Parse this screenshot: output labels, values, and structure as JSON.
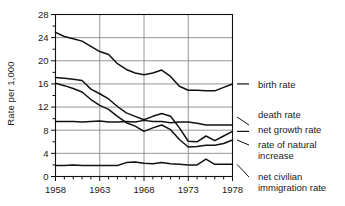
{
  "chart_data": {
    "type": "line",
    "title": "",
    "xlabel": "",
    "ylabel": "Rate per 1,000",
    "xlim": [
      1958,
      1978
    ],
    "ylim": [
      0,
      28
    ],
    "grid": true,
    "legend_position": "right",
    "x": [
      1958,
      1959,
      1960,
      1961,
      1962,
      1963,
      1964,
      1965,
      1966,
      1967,
      1968,
      1969,
      1970,
      1971,
      1972,
      1973,
      1974,
      1975,
      1976,
      1977,
      1978
    ],
    "y_ticks": [
      0,
      4,
      8,
      12,
      16,
      20,
      24,
      28
    ],
    "y_tick_labels": [
      "0",
      "4",
      "8",
      "12",
      "16",
      "20",
      "24",
      "28"
    ],
    "y_minor_step": 2,
    "x_ticks": [
      1958,
      1963,
      1968,
      1973,
      1978
    ],
    "x_tick_labels": [
      "1958",
      "1963",
      "1968",
      "1973",
      "1978"
    ],
    "x_minor_step": 1,
    "series": [
      {
        "name": "birth rate",
        "label": "birth rate",
        "values": [
          24.9,
          24.2,
          23.8,
          23.4,
          22.5,
          21.6,
          21.1,
          19.5,
          18.5,
          17.9,
          17.6,
          17.9,
          18.4,
          17.3,
          15.6,
          14.9,
          14.9,
          14.8,
          14.8,
          15.4,
          16.0
        ]
      },
      {
        "name": "death rate",
        "label": "death rate",
        "values": [
          9.5,
          9.5,
          9.5,
          9.4,
          9.5,
          9.6,
          9.4,
          9.4,
          9.5,
          9.4,
          9.7,
          9.5,
          9.5,
          9.3,
          9.4,
          9.4,
          9.2,
          8.9,
          8.9,
          8.9,
          8.9
        ]
      },
      {
        "name": "net growth rate",
        "label": "net growth rate",
        "values": [
          17.1,
          17.0,
          16.8,
          16.6,
          15.1,
          14.3,
          13.4,
          12.1,
          11.0,
          10.4,
          9.8,
          10.4,
          10.9,
          10.4,
          8.4,
          6.1,
          6.0,
          7.0,
          6.2,
          7.0,
          7.8
        ]
      },
      {
        "name": "rate of natural increase",
        "label": "rate of natural increase",
        "values": [
          16.1,
          15.7,
          15.2,
          14.6,
          13.3,
          12.3,
          11.6,
          10.4,
          9.3,
          8.7,
          7.8,
          8.4,
          8.9,
          8.1,
          6.4,
          5.1,
          5.2,
          5.4,
          5.4,
          5.7,
          6.3
        ]
      },
      {
        "name": "net civilian immigration rate",
        "label": "net civilian immigration rate",
        "values": [
          1.9,
          1.9,
          2.0,
          1.9,
          1.9,
          1.9,
          1.9,
          1.9,
          2.4,
          2.5,
          2.3,
          2.2,
          2.4,
          2.2,
          2.1,
          2.0,
          2.0,
          3.0,
          2.1,
          2.1,
          2.1
        ]
      }
    ],
    "legend_entries": [
      {
        "label": "birth rate",
        "anchor_value": 16.0
      },
      {
        "label": "death rate",
        "anchor_value": 8.9
      },
      {
        "label": "net growth rate",
        "anchor_value": 7.8
      },
      {
        "label": "rate of natural increase",
        "line1": "rate of natural",
        "line2": "increase",
        "anchor_value": 6.3
      },
      {
        "label": "net civilian immigration rate",
        "line1": "net civilian",
        "line2": "immigration rate",
        "anchor_value": 2.1
      }
    ],
    "colors": {
      "line": "#111111",
      "grid": "#8a8a8a",
      "axis": "#111111",
      "text": "#1a1a1a",
      "background": "#ffffff"
    }
  }
}
